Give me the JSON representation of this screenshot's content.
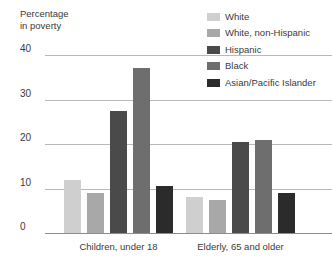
{
  "chart_data": {
    "type": "bar",
    "title": "",
    "subtitle": "",
    "xlabel": "",
    "ylabel": "Percentage\nin poverty",
    "ylim": [
      0,
      40
    ],
    "yticks": [
      0,
      10,
      20,
      30,
      40
    ],
    "ytick_labels": [
      "0",
      "10",
      "20",
      "30",
      "40"
    ],
    "grid": true,
    "legend_position": "top-right",
    "categories": [
      "Children, under 18",
      "Elderly, 65 and older"
    ],
    "series": [
      {
        "name": "White",
        "color": "#cfcfcf",
        "values": [
          12.0,
          8.0
        ]
      },
      {
        "name": "White, non-Hispanic",
        "color": "#a8a8a8",
        "values": [
          9.0,
          7.5
        ]
      },
      {
        "name": "Hispanic",
        "color": "#4a4a4a",
        "values": [
          27.5,
          20.5
        ]
      },
      {
        "name": "Black",
        "color": "#6e6e6e",
        "values": [
          37.0,
          20.8
        ]
      },
      {
        "name": "Asian/Pacific Islander",
        "color": "#2b2b2b",
        "values": [
          10.5,
          9.0
        ]
      }
    ]
  },
  "colors": {
    "gridline": "#b9b9b9",
    "baseline": "#8c8c8c",
    "text": "#3a3a3a",
    "background": "#ffffff"
  }
}
